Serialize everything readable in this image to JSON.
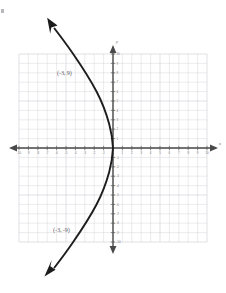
{
  "chart_data": {
    "type": "line",
    "title": "",
    "xlabel": "x",
    "ylabel": "y",
    "grid": true,
    "legend": "none",
    "xlim": [
      -10,
      10
    ],
    "ylim": [
      -10,
      10
    ],
    "x_ticks": [
      -10,
      -9,
      -8,
      -7,
      -6,
      -5,
      -4,
      -3,
      -2,
      -1,
      1,
      2,
      3,
      4,
      5,
      6,
      7,
      8,
      9,
      10
    ],
    "y_ticks": [
      -10,
      -9,
      -8,
      -7,
      -6,
      -5,
      -4,
      -3,
      -2,
      -1,
      1,
      2,
      3,
      4,
      5,
      6,
      7,
      8,
      9,
      10
    ],
    "x_tick_labels": [
      "-10",
      "-9",
      "-8",
      "-7",
      "-6",
      "-5",
      "-4",
      "-3",
      "-2",
      "-1",
      "1",
      "2",
      "3",
      "4",
      "5",
      "6",
      "7",
      "8",
      "9",
      "10"
    ],
    "y_tick_labels": [
      "-10",
      "-9",
      "-8",
      "-7",
      "-6",
      "-5",
      "-4",
      "-3",
      "-2",
      "-1",
      "1",
      "2",
      "3",
      "4",
      "5",
      "6",
      "7",
      "8",
      "9",
      "10"
    ],
    "series": [
      {
        "name": "sideways-parabola",
        "equation": "x = -y^2/9",
        "opens": "left",
        "vertex": [
          0,
          0
        ],
        "x": [
          0,
          -0.11,
          -0.44,
          -1.0,
          -1.78,
          -2.78,
          -4.0,
          -5.44,
          -7.11,
          -9.0,
          -11.11,
          -13.44
        ],
        "y": [
          0,
          1,
          2,
          3,
          4,
          5,
          6,
          7,
          8,
          9,
          10,
          11
        ]
      }
    ],
    "annotations": [
      {
        "text": "(-3, 9)",
        "x": -3,
        "y": 9,
        "role": "upper-point-label"
      },
      {
        "text": "(-3, -9)",
        "x": -3,
        "y": -9,
        "role": "lower-point-label"
      }
    ],
    "arrows": [
      "upper-left-end",
      "lower-left-end"
    ]
  },
  "graph": {
    "x_axis_label": "x",
    "y_axis_label": "y",
    "upper_point_label": "(-3, 9)",
    "lower_point_label": "(-3, -9)",
    "colors": {
      "curve": "#1c1c1c",
      "axis": "#4a4a4a",
      "grid": "#d8d8dc",
      "label_text": "#5e5e66",
      "background": "#ffffff"
    }
  }
}
